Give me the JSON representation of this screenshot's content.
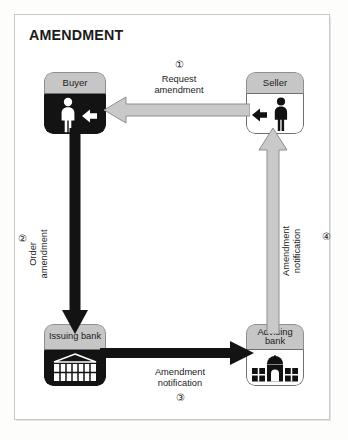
{
  "title": "AMENDMENT",
  "nodes": {
    "buyer": {
      "label": "Buyer",
      "icon": "person-icon",
      "style": "dark"
    },
    "seller": {
      "label": "Seller",
      "icon": "person-icon",
      "style": "light"
    },
    "issuing": {
      "label": "Issuing\nbank",
      "icon": "bank-building-icon",
      "style": "dark"
    },
    "advising": {
      "label": "Advising\nbank",
      "icon": "bank-domed-building-icon",
      "style": "light"
    }
  },
  "flows": [
    {
      "number": "①",
      "label": "Request\namendment",
      "from": "seller",
      "to": "buyer",
      "direction": "left",
      "color": "#c9c9c9"
    },
    {
      "number": "②",
      "label": "Order\namendment",
      "from": "buyer",
      "to": "issuing",
      "direction": "down",
      "color": "#131313"
    },
    {
      "number": "③",
      "label": "Amendment\nnotification",
      "from": "issuing",
      "to": "advising",
      "direction": "right",
      "color": "#131313"
    },
    {
      "number": "④",
      "label": "Amendment\nnotification",
      "from": "advising",
      "to": "seller",
      "direction": "up",
      "color": "#c9c9c9"
    }
  ],
  "colors": {
    "arrow_gray_fill": "#c9c9c9",
    "arrow_gray_stroke": "#8e8e8e",
    "arrow_black": "#131313",
    "header_gray": "#c6c6c6",
    "frame_border": "#c9c9c9"
  }
}
